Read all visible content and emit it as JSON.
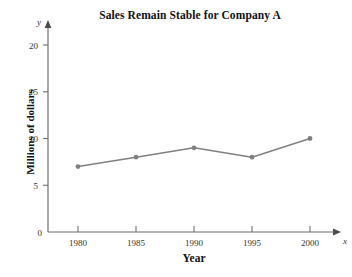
{
  "chart_data": {
    "type": "line",
    "title": "Sales Remain Stable for Company A",
    "xlabel": "Year",
    "ylabel": "Millions of dollars",
    "categories": [
      "1980",
      "1985",
      "1990",
      "1995",
      "2000"
    ],
    "x": [
      1980,
      1985,
      1990,
      1995,
      2000
    ],
    "values": [
      7,
      8,
      9,
      8,
      10
    ],
    "series": [
      {
        "name": "Company A sales",
        "values": [
          7,
          8,
          9,
          8,
          10
        ]
      }
    ],
    "xlim": [
      1977.5,
      2002.5
    ],
    "ylim": [
      0,
      21
    ],
    "x_ticks": [
      "1980",
      "1985",
      "1990",
      "1995",
      "2000"
    ],
    "y_ticks": [
      "0",
      "5",
      "10",
      "15",
      "20"
    ],
    "y_tick_values": [
      0,
      5,
      10,
      15,
      20
    ],
    "grid": false,
    "legend": "none",
    "x_axis_variable": "x",
    "y_axis_variable": "y",
    "series_color": "#808080",
    "marker": "circle",
    "axis_color": "#6e6e6e",
    "text_color": "#1a1a1a"
  },
  "axes": {
    "x_arrow": true,
    "y_arrow": true
  }
}
